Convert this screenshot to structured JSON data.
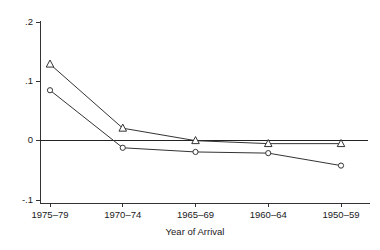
{
  "chart_data": {
    "type": "line",
    "title": "",
    "subtitle": "",
    "xlabel": "Year of Arrival",
    "ylabel": "",
    "categories": [
      "1975–79",
      "1970–74",
      "1965–69",
      "1960–64",
      "1950–59"
    ],
    "x_tick_labels": [
      "1975–79",
      "1970–74",
      "1965–69",
      "1960–64",
      "1950–59"
    ],
    "y_tick_labels": [
      ".2",
      ".1",
      "0",
      "-.1"
    ],
    "y_tick_values": [
      0.2,
      0.1,
      0,
      -0.1
    ],
    "ylim": [
      -0.1,
      0.2
    ],
    "xlim": [
      0,
      4
    ],
    "grid": false,
    "legend_position": "none",
    "zero_reference_line": 0,
    "series": [
      {
        "name": "triangle-series",
        "marker": "triangle",
        "color": "#333333",
        "marker_fill": "#ffffff",
        "values": [
          0.129,
          0.021,
          0.0,
          -0.005,
          -0.005
        ]
      },
      {
        "name": "circle-series",
        "marker": "circle",
        "color": "#333333",
        "marker_fill": "#ffffff",
        "values": [
          0.085,
          -0.012,
          -0.019,
          -0.021,
          -0.042
        ]
      }
    ]
  },
  "axes": {
    "x_axis_title": "Year of Arrival",
    "y_axis_title": ""
  },
  "colors": {
    "background": "#ffffff",
    "axis": "#333333",
    "ink": "#1a1a1a",
    "series_primary": "#333333",
    "series_secondary": "#333333"
  }
}
